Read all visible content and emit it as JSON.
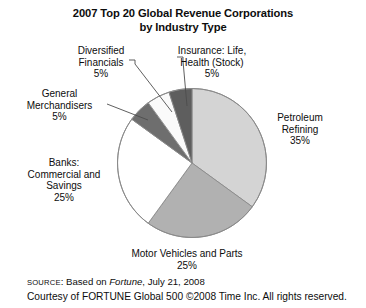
{
  "chart_data": {
    "type": "pie",
    "title": "2007 Top 20 Global Revenue Corporations by Industry Type",
    "title_line1": "2007 Top 20 Global Revenue Corporations",
    "title_line2": "by Industry Type",
    "xlabel": "",
    "ylabel": "",
    "legend_position": "none",
    "grid": false,
    "categories": [
      "Petroleum Refining",
      "Motor Vehicles and Parts",
      "Banks: Commercial and Savings",
      "General Merchandisers",
      "Diversified Financials",
      "Insurance: Life, Health (Stock)"
    ],
    "values": [
      35,
      25,
      25,
      5,
      5,
      5
    ],
    "value_unit": "%",
    "slice_colors": [
      "#d4d4d4",
      "#b1b1b1",
      "#ffffff",
      "#6e6e6e",
      "#fafafa",
      "#5e5e5e"
    ],
    "start_angle_deg": 0,
    "direction": "clockwise",
    "slices": [
      {
        "label": "Petroleum Refining",
        "value": 35,
        "color": "#d4d4d4",
        "start_deg": 0,
        "end_deg": 126
      },
      {
        "label": "Motor Vehicles and Parts",
        "value": 25,
        "color": "#b1b1b1",
        "start_deg": 126,
        "end_deg": 216
      },
      {
        "label": "Banks: Commercial and Savings",
        "value": 25,
        "color": "#ffffff",
        "start_deg": 216,
        "end_deg": 306
      },
      {
        "label": "General Merchandisers",
        "value": 5,
        "color": "#6e6e6e",
        "start_deg": 306,
        "end_deg": 324
      },
      {
        "label": "Diversified Financials",
        "value": 5,
        "color": "#fafafa",
        "start_deg": 324,
        "end_deg": 342
      },
      {
        "label": "Insurance: Life, Health (Stock)",
        "value": 5,
        "color": "#5e5e5e",
        "start_deg": 342,
        "end_deg": 360
      }
    ]
  },
  "labels": {
    "diversified": "Diversified\nFinancials\n5%",
    "insurance": "Insurance: Life,\nHealth (Stock)\n5%",
    "general": "General\nMerchandisers\n5%",
    "banks": "Banks:\nCommercial and\nSavings\n25%",
    "petroleum": "Petroleum\nRefining\n35%",
    "motor": "Motor Vehicles and Parts\n25%"
  },
  "footer": {
    "source_keyword": "SOURCE",
    "source_prefix": ": Based on ",
    "source_publication": "Fortune",
    "source_suffix": ", July 21, 2008",
    "courtesy": "Courtesy of FORTUNE Global 500 ©2008 Time Inc. All rights reserved."
  },
  "colors": {
    "background": "#ffffff",
    "text": "#0d0d0d",
    "outline": "#8a8a8a",
    "leader": "#4d4d4d"
  }
}
